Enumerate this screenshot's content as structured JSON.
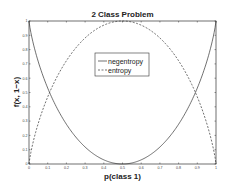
{
  "chart_data": {
    "type": "line",
    "title": "2 Class Problem",
    "xlabel": "p(class 1)",
    "ylabel": "f(x, 1−x)",
    "xlim": [
      0,
      1
    ],
    "ylim": [
      0,
      1
    ],
    "grid": false,
    "legend_position": "upper center",
    "x_ticks": [
      "0",
      "0.1",
      "0.2",
      "0.3",
      "0.4",
      "0.5",
      "0.6",
      "0.7",
      "0.8",
      "0.9",
      "1"
    ],
    "y_ticks": [
      "0",
      "0.1",
      "0.2",
      "0.3",
      "0.4",
      "0.5",
      "0.6",
      "0.7",
      "0.8",
      "0.9",
      "1"
    ],
    "x": [
      0.001,
      0.01,
      0.05,
      0.1,
      0.15,
      0.2,
      0.25,
      0.3,
      0.35,
      0.4,
      0.45,
      0.5,
      0.55,
      0.6,
      0.65,
      0.7,
      0.75,
      0.8,
      0.85,
      0.9,
      0.95,
      0.99,
      0.999
    ],
    "series": [
      {
        "name": "negentropy",
        "style": "solid",
        "values": [
          0.989,
          0.919,
          0.714,
          0.531,
          0.39,
          0.278,
          0.189,
          0.119,
          0.066,
          0.029,
          0.007,
          0.0,
          0.007,
          0.029,
          0.066,
          0.119,
          0.189,
          0.278,
          0.39,
          0.531,
          0.714,
          0.919,
          0.989
        ]
      },
      {
        "name": "entropy",
        "style": "dashed",
        "values": [
          0.011,
          0.081,
          0.286,
          0.469,
          0.61,
          0.722,
          0.811,
          0.881,
          0.934,
          0.971,
          0.993,
          1.0,
          0.993,
          0.971,
          0.934,
          0.881,
          0.811,
          0.722,
          0.61,
          0.469,
          0.286,
          0.081,
          0.011
        ]
      }
    ]
  },
  "legend": {
    "items": [
      {
        "label": "negentropy"
      },
      {
        "label": "entropy"
      }
    ]
  }
}
